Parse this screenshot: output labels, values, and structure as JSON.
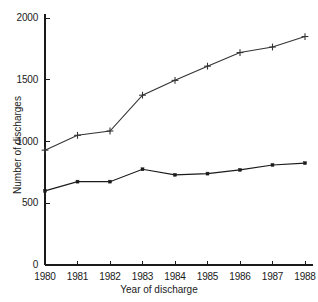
{
  "chart_data": {
    "type": "line",
    "title": "",
    "xlabel": "Year of discharge",
    "ylabel": "Number of discharges",
    "x": [
      1980,
      1981,
      1982,
      1983,
      1984,
      1985,
      1986,
      1987,
      1988
    ],
    "xtick_labels": [
      "1980",
      "1981",
      "1982",
      "1983",
      "1984",
      "1985",
      "1986",
      "1987",
      "1988"
    ],
    "ytick_labels": [
      "0",
      "500",
      "1000",
      "1500",
      "2000"
    ],
    "yticks": [
      0,
      500,
      1000,
      1500,
      2000
    ],
    "xlim": [
      1980,
      1988
    ],
    "ylim": [
      0,
      2000
    ],
    "grid": false,
    "legend": "none",
    "series": [
      {
        "name": "upper-series",
        "marker": "plus",
        "color": "#333333",
        "values": [
          930,
          1050,
          1085,
          1375,
          1495,
          1610,
          1720,
          1765,
          1850
        ]
      },
      {
        "name": "lower-series",
        "marker": "square",
        "color": "#1a1a1a",
        "values": [
          600,
          675,
          675,
          775,
          730,
          740,
          770,
          810,
          825
        ]
      }
    ]
  },
  "colors": {
    "background": "#ffffff",
    "axis": "#1a1a1a",
    "text": "#1a1a1a"
  }
}
